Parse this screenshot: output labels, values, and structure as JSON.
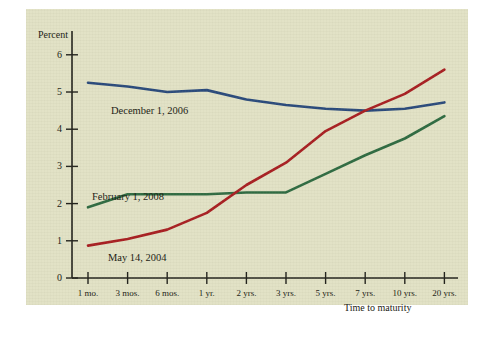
{
  "figure": {
    "background_color": "#e2e2c6",
    "y_axis_title": "Percent",
    "x_axis_title": "Time to maturity"
  },
  "chart_data": {
    "type": "line",
    "title": "",
    "subtitle": "",
    "xlabel": "Time to maturity",
    "ylabel": "Percent",
    "categories": [
      "1 mo.",
      "3 mos.",
      "6 mos.",
      "1 yr.",
      "2 yrs.",
      "3 yrs.",
      "5 yrs.",
      "7 yrs.",
      "10 yrs.",
      "20 yrs."
    ],
    "yticks": [
      0,
      1,
      2,
      3,
      4,
      5,
      6
    ],
    "ylim": [
      0,
      6.4
    ],
    "grid": false,
    "legend": "inline-annotations",
    "series": [
      {
        "name": "December 1, 2006",
        "color": "#2a4a7c",
        "values": [
          5.25,
          5.15,
          5.0,
          5.05,
          4.8,
          4.65,
          4.55,
          4.5,
          4.55,
          4.72
        ]
      },
      {
        "name": "February 1, 2008",
        "color": "#2f6b42",
        "values": [
          1.9,
          2.25,
          2.25,
          2.25,
          2.3,
          2.3,
          2.8,
          3.3,
          3.75,
          4.35
        ]
      },
      {
        "name": "May 14, 2004",
        "color": "#a81f22",
        "values": [
          0.87,
          1.05,
          1.3,
          1.75,
          2.5,
          3.1,
          3.95,
          4.5,
          4.95,
          5.6
        ]
      }
    ],
    "annotations": [
      {
        "text": "December 1, 2006",
        "series": "December 1, 2006"
      },
      {
        "text": "February 1, 2008",
        "series": "February 1, 2008"
      },
      {
        "text": "May 14, 2004",
        "series": "May 14, 2004"
      }
    ]
  }
}
